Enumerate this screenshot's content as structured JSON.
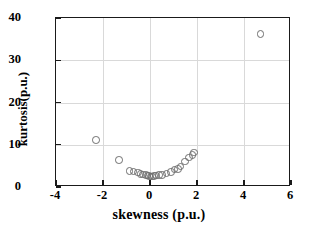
{
  "chart_data": {
    "type": "scatter",
    "title": "",
    "xlabel": "skewness (p.u.)",
    "ylabel": "kurtosis(p.u.)",
    "xlim": [
      -4,
      6
    ],
    "ylim": [
      0,
      40
    ],
    "xticks": [
      -4,
      -2,
      0,
      2,
      4,
      6
    ],
    "xticklabels": [
      "-4",
      "-2",
      "0",
      "2",
      "4",
      "6"
    ],
    "yticks": [
      0,
      10,
      20,
      30,
      40
    ],
    "yticklabels": [
      "0",
      "10",
      "20",
      "30",
      "40"
    ],
    "grid": true,
    "legend": null,
    "marker": {
      "shape": "circle-open",
      "edge_color": "#6e6e6e",
      "fill": "none",
      "size": 7.6
    },
    "series": [
      {
        "name": "data",
        "points": [
          {
            "x": -2.3,
            "y": 11.1
          },
          {
            "x": -1.33,
            "y": 6.4
          },
          {
            "x": -0.87,
            "y": 3.8
          },
          {
            "x": -0.7,
            "y": 3.7
          },
          {
            "x": -0.5,
            "y": 3.4
          },
          {
            "x": -0.4,
            "y": 3.1
          },
          {
            "x": -0.3,
            "y": 3.0
          },
          {
            "x": -0.18,
            "y": 2.9
          },
          {
            "x": -0.1,
            "y": 2.7
          },
          {
            "x": -0.04,
            "y": 2.6
          },
          {
            "x": 0.02,
            "y": 2.5
          },
          {
            "x": 0.08,
            "y": 2.5
          },
          {
            "x": 0.16,
            "y": 2.6
          },
          {
            "x": 0.26,
            "y": 2.7
          },
          {
            "x": 0.38,
            "y": 2.8
          },
          {
            "x": 0.5,
            "y": 2.9
          },
          {
            "x": 0.7,
            "y": 3.2
          },
          {
            "x": 0.9,
            "y": 3.6
          },
          {
            "x": 1.05,
            "y": 4.1
          },
          {
            "x": 1.18,
            "y": 4.3
          },
          {
            "x": 1.3,
            "y": 4.9
          },
          {
            "x": 1.5,
            "y": 6.0
          },
          {
            "x": 1.65,
            "y": 7.0
          },
          {
            "x": 1.8,
            "y": 7.6
          },
          {
            "x": 1.88,
            "y": 8.2
          },
          {
            "x": 4.7,
            "y": 36.2
          }
        ]
      }
    ]
  }
}
